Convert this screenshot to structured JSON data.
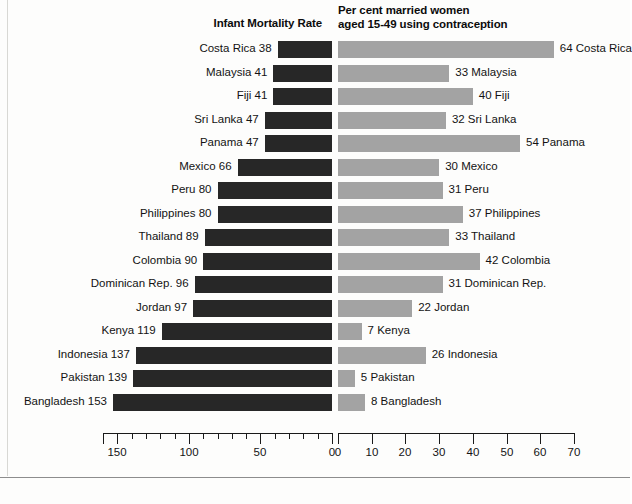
{
  "headers": {
    "left": "Infant Mortality Rate",
    "right": "Per cent married women\naged 15-49 using contraception"
  },
  "chart_data": {
    "type": "bar",
    "orientation": "horizontal-diverging",
    "title": "",
    "categories": [
      "Costa Rica",
      "Malaysia",
      "Fiji",
      "Sri Lanka",
      "Panama",
      "Mexico",
      "Peru",
      "Philippines",
      "Thailand",
      "Colombia",
      "Dominican Rep.",
      "Jordan",
      "Kenya",
      "Indonesia",
      "Pakistan",
      "Bangladesh"
    ],
    "series": [
      {
        "name": "Infant Mortality Rate",
        "side": "left",
        "color": "#272727",
        "values": [
          38,
          41,
          41,
          47,
          47,
          66,
          80,
          80,
          89,
          90,
          96,
          97,
          119,
          137,
          139,
          153
        ],
        "axis": {
          "min": 0,
          "max": 160,
          "direction": "right-to-left",
          "major_ticks": [
            150,
            100,
            50,
            0
          ],
          "major_tick_labels": [
            "150",
            "100",
            "50",
            "0"
          ],
          "minor_tick_step": 10
        }
      },
      {
        "name": "Per cent married women aged 15-49 using contraception",
        "side": "right",
        "color": "#a3a3a3",
        "values": [
          64,
          33,
          40,
          32,
          54,
          30,
          31,
          37,
          33,
          42,
          31,
          22,
          7,
          26,
          5,
          8
        ],
        "axis": {
          "min": 0,
          "max": 70,
          "direction": "left-to-right",
          "major_ticks": [
            0,
            10,
            20,
            30,
            40,
            50,
            60,
            70
          ],
          "major_tick_labels": [
            "0",
            "10",
            "20",
            "30",
            "40",
            "50",
            "60",
            "70"
          ]
        }
      }
    ],
    "grid": false,
    "legend": "none"
  },
  "rows": [
    {
      "label_left": "Costa Rica 38",
      "label_right": "64 Costa Rica"
    },
    {
      "label_left": "Malaysia 41",
      "label_right": "33 Malaysia"
    },
    {
      "label_left": "Fiji 41",
      "label_right": "40 Fiji"
    },
    {
      "label_left": "Sri Lanka 47",
      "label_right": "32 Sri Lanka"
    },
    {
      "label_left": "Panama 47",
      "label_right": "54 Panama"
    },
    {
      "label_left": "Mexico 66",
      "label_right": "30 Mexico"
    },
    {
      "label_left": "Peru 80",
      "label_right": "31 Peru"
    },
    {
      "label_left": "Philippines 80",
      "label_right": "37 Philippines"
    },
    {
      "label_left": "Thailand 89",
      "label_right": "33 Thailand"
    },
    {
      "label_left": "Colombia 90",
      "label_right": "42 Colombia"
    },
    {
      "label_left": "Dominican Rep. 96",
      "label_right": "31 Dominican Rep."
    },
    {
      "label_left": "Jordan 97",
      "label_right": "22 Jordan"
    },
    {
      "label_left": "Kenya 119",
      "label_right": "7 Kenya"
    },
    {
      "label_left": "Indonesia 137",
      "label_right": "26 Indonesia"
    },
    {
      "label_left": "Pakistan 139",
      "label_right": "5 Pakistan"
    },
    {
      "label_left": "Bangladesh 153",
      "label_right": "8 Bangladesh"
    }
  ]
}
